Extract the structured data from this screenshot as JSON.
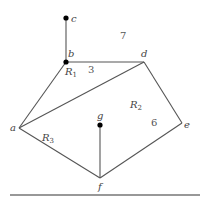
{
  "diagram": {
    "type": "planar-graph",
    "vertices": [
      {
        "id": "a",
        "label": "a",
        "x": 19,
        "y": 128,
        "dot": false
      },
      {
        "id": "b",
        "label": "b",
        "x": 66,
        "y": 62,
        "dot": true
      },
      {
        "id": "c",
        "label": "c",
        "x": 66,
        "y": 18,
        "dot": true
      },
      {
        "id": "d",
        "label": "d",
        "x": 144,
        "y": 62,
        "dot": false
      },
      {
        "id": "e",
        "label": "e",
        "x": 182,
        "y": 123,
        "dot": false
      },
      {
        "id": "f",
        "label": "f",
        "x": 100,
        "y": 178,
        "dot": false
      },
      {
        "id": "g",
        "label": "g",
        "x": 100,
        "y": 125,
        "dot": true
      }
    ],
    "edges": [
      [
        "b",
        "c"
      ],
      [
        "b",
        "d"
      ],
      [
        "a",
        "b"
      ],
      [
        "a",
        "d"
      ],
      [
        "d",
        "e"
      ],
      [
        "e",
        "f"
      ],
      [
        "a",
        "f"
      ],
      [
        "f",
        "g"
      ]
    ],
    "regions": [
      {
        "name": "R",
        "sub": "1",
        "degree": "3"
      },
      {
        "name": "R",
        "sub": "2",
        "degree": "6"
      },
      {
        "name": "R",
        "sub": "3",
        "degree": ""
      },
      {
        "name": "",
        "sub": "",
        "degree": "7"
      }
    ],
    "labels": {
      "a": "a",
      "b": "b",
      "c": "c",
      "d": "d",
      "e": "e",
      "f": "f",
      "g": "g",
      "R": "R",
      "r1_sub": "1",
      "r2_sub": "2",
      "r3_sub": "3",
      "deg_r1": "3",
      "deg_r2": "6",
      "deg_outer": "7"
    }
  }
}
